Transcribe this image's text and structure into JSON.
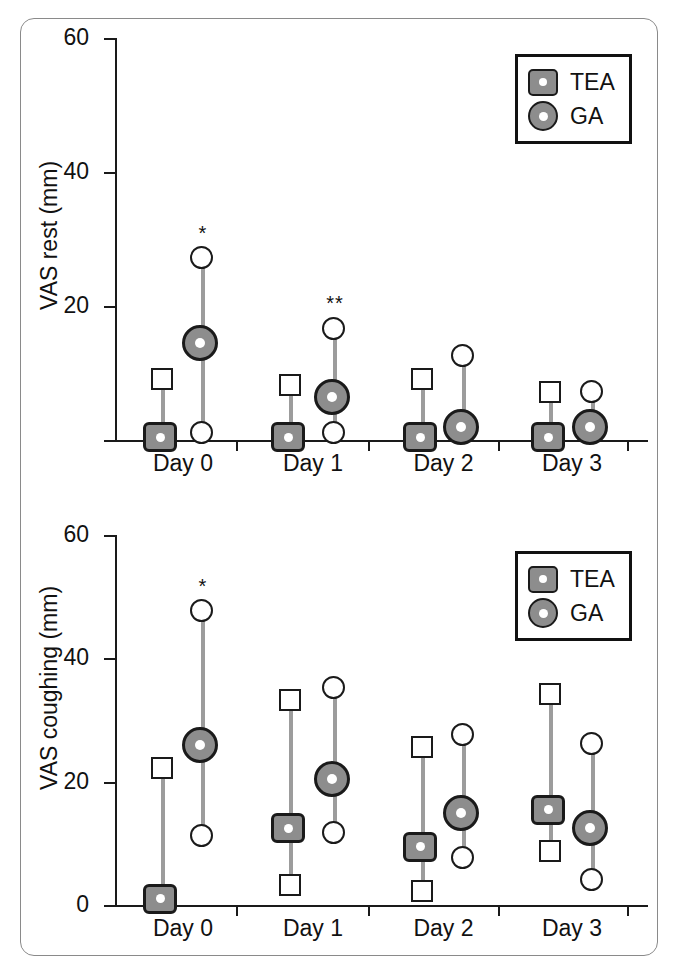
{
  "figure": {
    "panels": [
      "rest",
      "coughing"
    ],
    "group_labels": [
      "Day 0",
      "Day 1",
      "Day 2",
      "Day 3"
    ],
    "legend": {
      "tea_label": "TEA",
      "ga_label": "GA",
      "tea_marker": "rounded-square-gray",
      "ga_marker": "circle-gray"
    },
    "colors": {
      "marker_fill": "#8d8d8d",
      "marker_edge": "#1a1a1a",
      "whisker": "#9c9c9c",
      "axis": "#1a1a1a",
      "frame": "#8a8a8a",
      "background": "#ffffff"
    }
  },
  "chart_data": [
    {
      "type": "scatter",
      "title": "",
      "panel_id": "vas-rest",
      "xlabel": "",
      "ylabel": "VAS rest (mm)",
      "categories": [
        "Day 0",
        "Day 1",
        "Day 2",
        "Day 3"
      ],
      "ylim": [
        0,
        60
      ],
      "yticks": [
        0,
        20,
        40,
        60
      ],
      "ytick_labels": [
        "",
        "20",
        "40",
        "60"
      ],
      "grid": false,
      "legend_position": "top-right",
      "series": [
        {
          "name": "TEA",
          "marker": "rounded-square-gray",
          "median": [
            0,
            0,
            0,
            0
          ],
          "lower": [
            0,
            0,
            0,
            0
          ],
          "upper": [
            9,
            8,
            9,
            7
          ],
          "significance": [
            "",
            "",
            "",
            ""
          ]
        },
        {
          "name": "GA",
          "marker": "circle-gray",
          "median": [
            14,
            6,
            1.5,
            1.5
          ],
          "lower": [
            1,
            1,
            1.5,
            1.5
          ],
          "upper": [
            27,
            16.5,
            12.5,
            7
          ],
          "significance": [
            "*",
            "**",
            "",
            ""
          ]
        }
      ]
    },
    {
      "type": "scatter",
      "title": "",
      "panel_id": "vas-coughing",
      "xlabel": "",
      "ylabel": "VAS coughing (mm)",
      "categories": [
        "Day 0",
        "Day 1",
        "Day 2",
        "Day 3"
      ],
      "ylim": [
        0,
        60
      ],
      "yticks": [
        0,
        20,
        40,
        60
      ],
      "ytick_labels": [
        "0",
        "20",
        "40",
        "60"
      ],
      "grid": false,
      "legend_position": "top-right",
      "series": [
        {
          "name": "TEA",
          "marker": "rounded-square-gray",
          "median": [
            0.5,
            12,
            9,
            15
          ],
          "lower": [
            0.5,
            3,
            2,
            8.5
          ],
          "upper": [
            22,
            33,
            25.5,
            34
          ],
          "significance": [
            "",
            "",
            "",
            ""
          ]
        },
        {
          "name": "GA",
          "marker": "circle-gray",
          "median": [
            25.5,
            20,
            14.5,
            12
          ],
          "lower": [
            11,
            11.5,
            7.5,
            4
          ],
          "upper": [
            47.5,
            35,
            27.5,
            26
          ],
          "significance": [
            "*",
            "",
            "",
            ""
          ]
        }
      ]
    }
  ]
}
